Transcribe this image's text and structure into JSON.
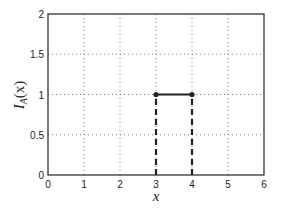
{
  "chart_data": {
    "type": "line",
    "title": "",
    "xlabel": "x",
    "ylabel": "I_A(x)",
    "ylabel_main": "I",
    "ylabel_sub": "A",
    "ylabel_arg": "(x)",
    "xlim": [
      0,
      6
    ],
    "ylim": [
      0,
      2
    ],
    "xticks": [
      0,
      1,
      2,
      3,
      4,
      5,
      6
    ],
    "xtick_labels": [
      "0",
      "1",
      "2",
      "3",
      "4",
      "5",
      "6"
    ],
    "yticks": [
      0,
      0.5,
      1,
      1.5,
      2
    ],
    "ytick_labels": [
      "0",
      "0.5",
      "1",
      "1.5",
      "2"
    ],
    "grid": true,
    "grid_style": "dotted",
    "legend": null,
    "series": [
      {
        "name": "indicator-segment",
        "style": "solid",
        "x": [
          3,
          4
        ],
        "y": [
          1,
          1
        ],
        "markers": "filled-circle"
      },
      {
        "name": "drop-x3",
        "style": "dashed",
        "x": [
          3,
          3
        ],
        "y": [
          0,
          1
        ]
      },
      {
        "name": "drop-x4",
        "style": "dashed",
        "x": [
          4,
          4
        ],
        "y": [
          0,
          1
        ]
      }
    ],
    "line_color": "#222222"
  }
}
